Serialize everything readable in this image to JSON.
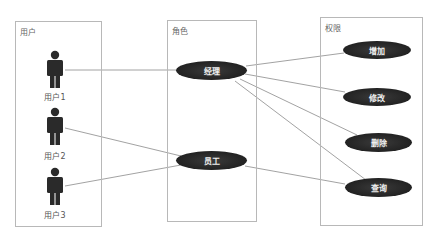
{
  "caption": "",
  "panels": {
    "users": {
      "title": "用户"
    },
    "roles": {
      "title": "角色"
    },
    "permissions": {
      "title": "权限"
    }
  },
  "actors": [
    {
      "id": "user1",
      "label": "用户1"
    },
    {
      "id": "user2",
      "label": "用户2"
    },
    {
      "id": "user3",
      "label": "用户3"
    }
  ],
  "roles": [
    {
      "id": "manager",
      "label": "经理"
    },
    {
      "id": "employee",
      "label": "员工"
    }
  ],
  "permissions": [
    {
      "id": "add",
      "label": "增加"
    },
    {
      "id": "edit",
      "label": "修改"
    },
    {
      "id": "delete",
      "label": "删除"
    },
    {
      "id": "query",
      "label": "查询"
    }
  ],
  "relations": [
    {
      "from": "用户1",
      "to": "经理"
    },
    {
      "from": "用户2",
      "to": "员工"
    },
    {
      "from": "用户3",
      "to": "员工"
    },
    {
      "from": "经理",
      "to": "增加"
    },
    {
      "from": "经理",
      "to": "修改"
    },
    {
      "from": "经理",
      "to": "删除"
    },
    {
      "from": "经理",
      "to": "查询"
    },
    {
      "from": "员工",
      "to": "查询"
    }
  ],
  "colors": {
    "usecase_fill": "#222222",
    "line": "#888888",
    "border": "#b8b8b8",
    "actor": "#2a2a2a"
  }
}
